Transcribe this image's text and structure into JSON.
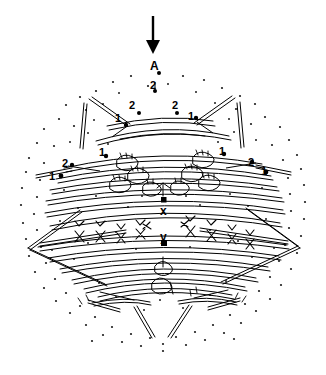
{
  "figure": {
    "kind": "line-drawing-diagram",
    "background_color": "#ffffff",
    "ink_color": "#000000",
    "stipple_color": "#1a1a1a",
    "width": 326,
    "height": 375
  },
  "annotations": {
    "arrow": {
      "name": "pointer-arrow",
      "direction": "down",
      "x": 153,
      "y_start": 16,
      "y_end": 52
    },
    "labels": [
      {
        "id": "a",
        "text": "A",
        "x": 150,
        "y": 60,
        "size": "cap"
      },
      {
        "id": "t2",
        "text": "2",
        "x": 150,
        "y": 80,
        "size": "num"
      },
      {
        "id": "l2a",
        "text": "2",
        "x": 129,
        "y": 100,
        "size": "num"
      },
      {
        "id": "r2a",
        "text": "2",
        "x": 172,
        "y": 100,
        "size": "num"
      },
      {
        "id": "l1a",
        "text": "1",
        "x": 115,
        "y": 113,
        "size": "num"
      },
      {
        "id": "r1a",
        "text": "1",
        "x": 188,
        "y": 111,
        "size": "num"
      },
      {
        "id": "l1b",
        "text": "1",
        "x": 99,
        "y": 147,
        "size": "num"
      },
      {
        "id": "r1b",
        "text": "1",
        "x": 219,
        "y": 146,
        "size": "num"
      },
      {
        "id": "l2b",
        "text": "2",
        "x": 62,
        "y": 158,
        "size": "num"
      },
      {
        "id": "r2b",
        "text": "2",
        "x": 248,
        "y": 157,
        "size": "num"
      },
      {
        "id": "l1c",
        "text": "1",
        "x": 49,
        "y": 171,
        "size": "num"
      },
      {
        "id": "r1c",
        "text": "1",
        "x": 261,
        "y": 166,
        "size": "num"
      },
      {
        "id": "x",
        "text": "x",
        "x": 160,
        "y": 205,
        "size": "low"
      },
      {
        "id": "y",
        "text": "y",
        "x": 160,
        "y": 231,
        "size": "low"
      }
    ]
  },
  "structure": {
    "outline_note": "oval stippled field",
    "marker_dots": [
      {
        "name": "dot-a",
        "x": 159,
        "y": 73
      },
      {
        "name": "dot-2t",
        "x": 155,
        "y": 91
      },
      {
        "name": "dot-l2a",
        "x": 139,
        "y": 113
      },
      {
        "name": "dot-r2a",
        "x": 177,
        "y": 113
      },
      {
        "name": "dot-l1a",
        "x": 126,
        "y": 125
      },
      {
        "name": "dot-r1a",
        "x": 196,
        "y": 118
      },
      {
        "name": "dot-l1b",
        "x": 106,
        "y": 156
      },
      {
        "name": "dot-r1b",
        "x": 224,
        "y": 154
      },
      {
        "name": "dot-l2b",
        "x": 72,
        "y": 165
      },
      {
        "name": "dot-r2b",
        "x": 252,
        "y": 162
      },
      {
        "name": "dot-l1c",
        "x": 61,
        "y": 176
      },
      {
        "name": "dot-r1c",
        "x": 266,
        "y": 172
      },
      {
        "name": "dot-x",
        "x": 164,
        "y": 200
      },
      {
        "name": "dot-y",
        "x": 164,
        "y": 243
      }
    ]
  }
}
